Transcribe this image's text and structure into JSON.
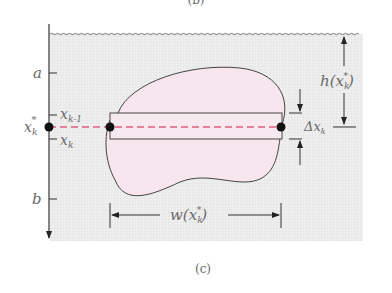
{
  "figure": {
    "top_caption_fragment": "(b)",
    "caption": "(c)",
    "axis_labels": {
      "a": "a",
      "b": "b",
      "x_star": "x",
      "x_star_sub": "k",
      "x_k_minus_1": "x",
      "x_k_minus_1_sub": "k-1",
      "x_k": "x",
      "x_k_sub": "k"
    },
    "dimensions": {
      "depth_label": "h(x",
      "depth_label_sub": "k",
      "depth_label_close": ")",
      "width_label": "w(x",
      "width_label_sub": "k",
      "width_label_close": ")",
      "thickness_label": "Δx",
      "thickness_label_sub": "k"
    },
    "colors": {
      "fluid_background": "#ebebeb",
      "plate_fill": "#f8e6ee",
      "dashed_line": "#e0607e",
      "line": "#444444",
      "dot": "#111111"
    }
  }
}
